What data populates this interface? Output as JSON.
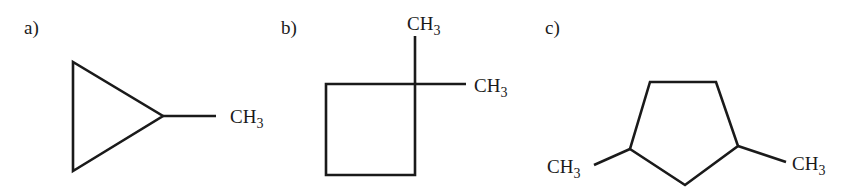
{
  "panels": [
    {
      "label": "a)",
      "molecule": "methylcyclopropane",
      "groups": [
        {
          "text": "CH",
          "sub": "3"
        }
      ]
    },
    {
      "label": "b)",
      "molecule": "1,1-dimethylcyclobutane",
      "groups": [
        {
          "text": "CH",
          "sub": "3"
        },
        {
          "text": "CH",
          "sub": "3"
        }
      ]
    },
    {
      "label": "c)",
      "molecule": "1,3-dimethylcyclopentane",
      "groups": [
        {
          "text": "CH",
          "sub": "3"
        },
        {
          "text": "CH",
          "sub": "3"
        }
      ]
    }
  ],
  "colors": {
    "ink": "#1a1a1a",
    "background": "#ffffff"
  }
}
